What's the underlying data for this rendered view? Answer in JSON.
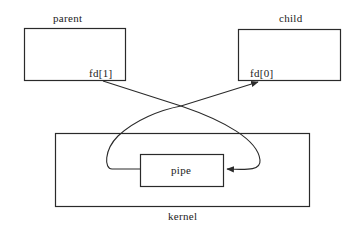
{
  "diagram": {
    "parent": {
      "label": "parent",
      "fd_label": "fd[1]"
    },
    "child": {
      "label": "child",
      "fd_label": "fd[0]"
    },
    "kernel": {
      "label": "kernel"
    },
    "pipe": {
      "label": "pipe"
    },
    "colors": {
      "stroke": "#2a2a2a",
      "background": "#ffffff",
      "text": "#222222"
    },
    "edges": [
      {
        "from": "parent.fd[1]",
        "to": "pipe",
        "direction": "write"
      },
      {
        "from": "pipe",
        "to": "child.fd[0]",
        "direction": "read"
      }
    ]
  }
}
